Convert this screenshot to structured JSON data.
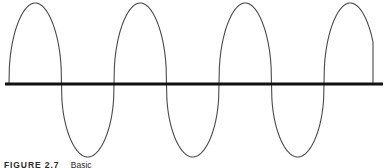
{
  "figure": {
    "caption_label": "FIGURE 2.7",
    "caption_text": "Basic",
    "background_color": "#ffffff",
    "axis_color": "#111111",
    "curve_color": "#4a4a4a",
    "caption_color": "#2b2b2b"
  },
  "chart_data": {
    "type": "line",
    "title": "",
    "subtitle": "",
    "xlabel": "",
    "ylabel": "",
    "grid": false,
    "legend": "none",
    "annotations": [],
    "waveform_name": "clipped-sine-wave",
    "amplitude": 1.0,
    "cycles_shown": 3.5,
    "period_px": 105,
    "zero_axis_y_px": 84,
    "peak_y_px": 3,
    "trough_y_px": 157,
    "axis_start_x_px": 5,
    "axis_end_x_px": 383,
    "curve_start_x_px": 9,
    "curve_end_x_px": 373,
    "axis_stroke_px": 3,
    "curve_stroke_px": 1.1,
    "flatness_exponent": 0.42,
    "peaks_x_px": [
      33,
      140,
      245,
      348
    ],
    "troughs_x_px": [
      78,
      190,
      295
    ],
    "zero_crossings_x_px": [
      9,
      58,
      108,
      163,
      213,
      268,
      318,
      373
    ],
    "xlim": [
      0,
      387
    ],
    "ylim": [
      -1.1,
      1.1
    ],
    "x": [],
    "values": []
  }
}
